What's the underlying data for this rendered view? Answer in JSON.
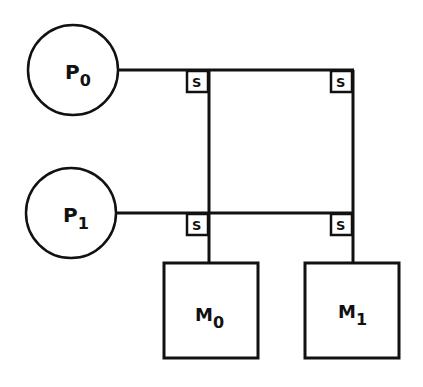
{
  "diagram": {
    "type": "crossbar-interconnect",
    "stroke_color": "#111111",
    "background": "#ffffff",
    "processors": [
      {
        "id": "P0",
        "letter": "P",
        "sub": "0"
      },
      {
        "id": "P1",
        "letter": "P",
        "sub": "1"
      }
    ],
    "memories": [
      {
        "id": "M0",
        "letter": "M",
        "sub": "0"
      },
      {
        "id": "M1",
        "letter": "M",
        "sub": "1"
      }
    ],
    "switches": [
      {
        "label": "S",
        "row": "P0",
        "col": "M0"
      },
      {
        "label": "S",
        "row": "P0",
        "col": "M1"
      },
      {
        "label": "S",
        "row": "P1",
        "col": "M0"
      },
      {
        "label": "S",
        "row": "P1",
        "col": "M1"
      }
    ]
  }
}
